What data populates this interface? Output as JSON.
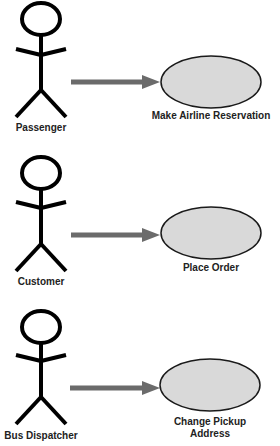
{
  "diagram": {
    "type": "use-case",
    "colors": {
      "line": "#000000",
      "arrow": "#6b6b6b",
      "ellipse_fill": "#d9d9d9",
      "ellipse_stroke": "#1a1a1a",
      "text": "#222222"
    },
    "rows": [
      {
        "actor": "Passenger",
        "use_case": "Make Airline Reservation"
      },
      {
        "actor": "Customer",
        "use_case": "Place Order"
      },
      {
        "actor": "Bus Dispatcher",
        "use_case": "Change Pickup Address"
      }
    ]
  }
}
